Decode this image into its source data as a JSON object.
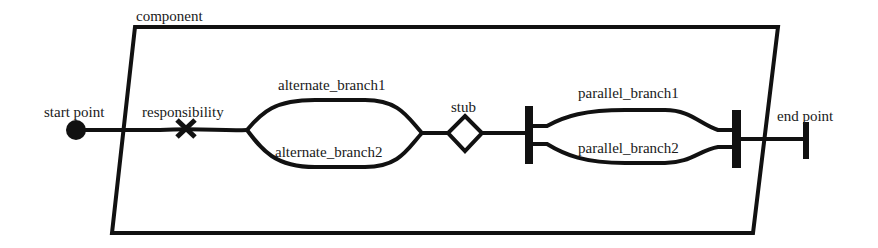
{
  "diagram": {
    "type": "use-case-map",
    "stroke_color": "#111111",
    "background": "#ffffff",
    "component": {
      "label": "component"
    },
    "start": {
      "label": "start point"
    },
    "responsibility": {
      "label": "responsibility"
    },
    "or_fork": {
      "branches": [
        {
          "label": "alternate_branch1"
        },
        {
          "label": "alternate_branch2"
        }
      ]
    },
    "stub": {
      "label": "stub"
    },
    "and_fork": {
      "branches": [
        {
          "label": "parallel_branch1"
        },
        {
          "label": "parallel_branch2"
        }
      ]
    },
    "end": {
      "label": "end point"
    }
  }
}
